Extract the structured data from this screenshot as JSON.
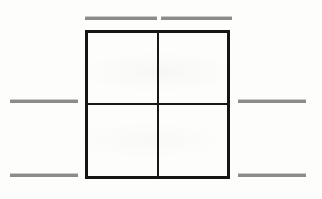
{
  "canvas": {
    "width": 322,
    "height": 199,
    "background_color": "#fdfdfb",
    "title": "Four-quadrant square with flanking rule segments"
  },
  "figure": {
    "name": "quadrant-square",
    "stroke_color": "#151515",
    "border_width": 3,
    "divider_color": "#181818",
    "divider_width": 2,
    "x": 85,
    "y": 30,
    "width": 145,
    "height": 149,
    "quadrants": [
      {
        "id": "top-left",
        "label": ""
      },
      {
        "id": "top-right",
        "label": ""
      },
      {
        "id": "bottom-left",
        "label": ""
      },
      {
        "id": "bottom-right",
        "label": ""
      }
    ],
    "divider_vertical_x": 157,
    "divider_horizontal_y": 103
  },
  "rules": {
    "color": "#8b8b8b",
    "thickness": 3,
    "segments": [
      {
        "id": "top-left-rule",
        "x": 85,
        "y": 17,
        "width": 72,
        "label": ""
      },
      {
        "id": "top-right-rule",
        "x": 161,
        "y": 17,
        "width": 71,
        "label": ""
      },
      {
        "id": "mid-left-rule",
        "x": 10,
        "y": 100,
        "width": 68,
        "label": ""
      },
      {
        "id": "mid-right-rule",
        "x": 238,
        "y": 100,
        "width": 68,
        "label": ""
      },
      {
        "id": "bottom-left-rule",
        "x": 10,
        "y": 174,
        "width": 68,
        "label": ""
      },
      {
        "id": "bottom-right-rule",
        "x": 238,
        "y": 174,
        "width": 68,
        "label": ""
      }
    ]
  }
}
